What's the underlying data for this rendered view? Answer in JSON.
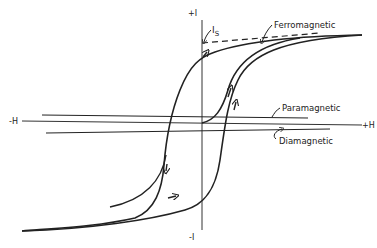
{
  "diagram": {
    "type": "magnetization-curves",
    "axes": {
      "y_top": "+I",
      "y_bottom": "-I",
      "x_left": "-H",
      "x_right": "+H"
    },
    "labels": {
      "saturation": "I",
      "saturation_sub": "S",
      "ferromagnetic": "Ferromagnetic",
      "paramagnetic": "Paramagnetic",
      "diamagnetic": "Diamagnetic"
    },
    "colors": {
      "ink": "#222222",
      "background": "#ffffff"
    }
  }
}
